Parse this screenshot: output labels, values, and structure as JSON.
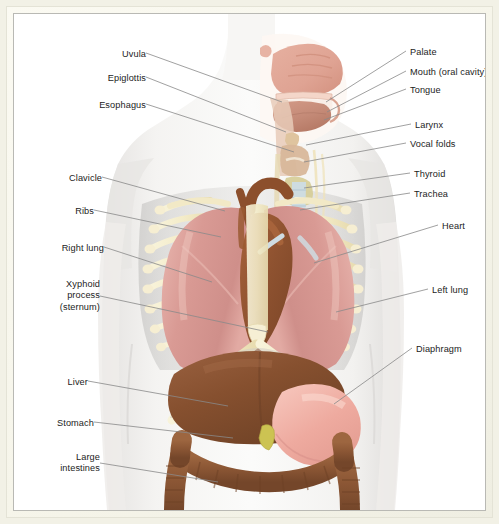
{
  "figure": {
    "kind": "anatomical-illustration",
    "frame_color": "#f2f1e6",
    "matte_color": "#f7f6ec",
    "plate_background": "#ffffff",
    "leader_color": "#8a8a8a",
    "label_color": "#1c1c1c"
  },
  "labels_left": [
    {
      "text": "Uvula",
      "x": 96,
      "y": 35,
      "lx": 132,
      "ly": 39,
      "tx": 268,
      "ty": 88
    },
    {
      "text": "Epiglottis",
      "x": 82,
      "y": 59,
      "lx": 132,
      "ly": 63,
      "tx": 272,
      "ty": 118
    },
    {
      "text": "Esophagus",
      "x": 74,
      "y": 86,
      "lx": 132,
      "ly": 90,
      "tx": 280,
      "ty": 138
    },
    {
      "text": "Clavicle",
      "x": 36,
      "y": 159,
      "lx": 88,
      "ly": 163,
      "tx": 211,
      "ty": 197
    },
    {
      "text": "Ribs",
      "x": 50,
      "y": 192,
      "lx": 80,
      "ly": 196,
      "tx": 207,
      "ty": 223
    },
    {
      "text": "Right lung",
      "x": 24,
      "y": 229,
      "lx": 90,
      "ly": 233,
      "tx": 198,
      "ty": 268
    },
    {
      "text": "Xyphoid\nprocess\n(sternum)",
      "x": 26,
      "y": 265,
      "lx": 86,
      "ly": 282,
      "tx": 254,
      "ty": 318
    },
    {
      "text": "Liver",
      "x": 46,
      "y": 363,
      "lx": 74,
      "ly": 367,
      "tx": 214,
      "ty": 392
    },
    {
      "text": "Stomach",
      "x": 29,
      "y": 404,
      "lx": 80,
      "ly": 408,
      "tx": 219,
      "ty": 424
    },
    {
      "text": "Large\nintestines",
      "x": 34,
      "y": 438,
      "lx": 86,
      "ly": 449,
      "tx": 204,
      "ty": 468
    }
  ],
  "labels_right": [
    {
      "text": "Palate",
      "x": 396,
      "y": 33,
      "lx": 392,
      "ly": 37,
      "tx": 312,
      "ty": 88
    },
    {
      "text": "Mouth (oral cavity)",
      "x": 396,
      "y": 53,
      "lx": 392,
      "ly": 57,
      "tx": 313,
      "ty": 98
    },
    {
      "text": "Tongue",
      "x": 396,
      "y": 71,
      "lx": 392,
      "ly": 75,
      "tx": 310,
      "ty": 106
    },
    {
      "text": "Larynx",
      "x": 401,
      "y": 106,
      "lx": 397,
      "ly": 110,
      "tx": 292,
      "ty": 131
    },
    {
      "text": "Vocal folds",
      "x": 396,
      "y": 125,
      "lx": 392,
      "ly": 129,
      "tx": 290,
      "ty": 148
    },
    {
      "text": "Thyroid",
      "x": 400,
      "y": 155,
      "lx": 396,
      "ly": 159,
      "tx": 290,
      "ty": 174
    },
    {
      "text": "Trachea",
      "x": 400,
      "y": 175,
      "lx": 396,
      "ly": 179,
      "tx": 286,
      "ty": 196
    },
    {
      "text": "Heart",
      "x": 428,
      "y": 207,
      "lx": 424,
      "ly": 211,
      "tx": 300,
      "ty": 249
    },
    {
      "text": "Left lung",
      "x": 418,
      "y": 271,
      "lx": 414,
      "ly": 275,
      "tx": 322,
      "ty": 298
    },
    {
      "text": "Diaphragm",
      "x": 402,
      "y": 330,
      "lx": 398,
      "ly": 334,
      "tx": 320,
      "ty": 390
    }
  ],
  "structures": [
    {
      "name": "body-silhouette",
      "color": "#f0eeec"
    },
    {
      "name": "nasal-cavity",
      "color": "#dfa393"
    },
    {
      "name": "tongue",
      "color": "#c88f7d"
    },
    {
      "name": "palate",
      "color": "#f2cfc4"
    },
    {
      "name": "larynx",
      "color": "#d4b49a"
    },
    {
      "name": "thyroid",
      "color": "#d8cf9a"
    },
    {
      "name": "trachea",
      "color": "#c8d8e0"
    },
    {
      "name": "right-lung",
      "color": "#d99a94"
    },
    {
      "name": "left-lung",
      "color": "#d99a94"
    },
    {
      "name": "heart",
      "color": "#9b5a34"
    },
    {
      "name": "aorta",
      "color": "#8c4f2c"
    },
    {
      "name": "ribs",
      "color": "#f4ecce"
    },
    {
      "name": "sternum",
      "color": "#f6efd4"
    },
    {
      "name": "diaphragm",
      "color": "#cfcac4"
    },
    {
      "name": "liver",
      "color": "#8a5433"
    },
    {
      "name": "stomach",
      "color": "#eeaa9f"
    },
    {
      "name": "gallbladder",
      "color": "#ccc352"
    },
    {
      "name": "large-intestine",
      "color": "#8c5735"
    }
  ]
}
